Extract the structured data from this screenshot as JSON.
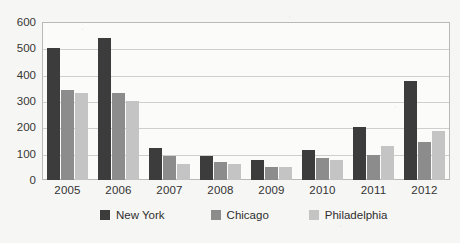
{
  "chart_data": {
    "type": "bar",
    "title": "",
    "subtitle": "",
    "xlabel": "",
    "ylabel": "",
    "categories": [
      "2005",
      "2006",
      "2007",
      "2008",
      "2009",
      "2010",
      "2011",
      "2012"
    ],
    "series": [
      {
        "name": "New York",
        "color": "#3c3c3c",
        "values": [
          500,
          540,
          120,
          90,
          75,
          115,
          200,
          375
        ]
      },
      {
        "name": "Chicago",
        "color": "#8c8c8c",
        "values": [
          340,
          330,
          90,
          70,
          50,
          85,
          95,
          145
        ]
      },
      {
        "name": "Philadelphia",
        "color": "#c4c4c4",
        "values": [
          330,
          300,
          60,
          60,
          50,
          75,
          130,
          185
        ]
      }
    ],
    "ylim": [
      0,
      600
    ],
    "ytick_step": 100,
    "ytick_labels": [
      "0",
      "100",
      "200",
      "300",
      "400",
      "500",
      "600"
    ],
    "grid": true,
    "legend_position": "bottom"
  },
  "legend": {
    "items": [
      {
        "label": "New York"
      },
      {
        "label": "Chicago"
      },
      {
        "label": "Philadelphia"
      }
    ]
  }
}
